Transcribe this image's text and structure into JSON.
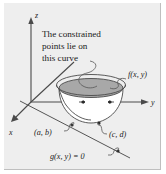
{
  "figure": {
    "caption_lines": [
      "The constrained",
      "points lie on",
      "this curve"
    ],
    "axes": {
      "x_label": "x",
      "y_label": "y",
      "z_label": "z"
    },
    "labels": {
      "surface": "f(x, y)",
      "point_ab": "(a, b)",
      "point_cd": "(c, d)",
      "constraint": "g(x, y) = 0"
    },
    "colors": {
      "panel_background": "#eeeeee",
      "page_background": "#ffffff",
      "ink": "#1a1a1a",
      "line": "#4a4a4a",
      "bowl_shade": "#a8a8a8",
      "bowl_fill": "#ffffff",
      "border": "#bfbfbf"
    }
  }
}
